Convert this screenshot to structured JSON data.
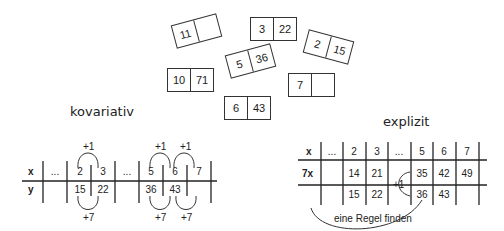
{
  "cards": [
    {
      "left": "11",
      "right": "",
      "x": 173,
      "y": 19,
      "rot": -15
    },
    {
      "left": "3",
      "right": "22",
      "x": 250,
      "y": 17,
      "rot": 0
    },
    {
      "left": "2",
      "right": "15",
      "x": 305,
      "y": 35,
      "rot": 15
    },
    {
      "left": "5",
      "right": "36",
      "x": 227,
      "y": 49,
      "rot": -15
    },
    {
      "left": "10",
      "right": "71",
      "x": 167,
      "y": 68,
      "rot": 0
    },
    {
      "left": "7",
      "right": "",
      "x": 288,
      "y": 73,
      "rot": 0
    },
    {
      "left": "6",
      "right": "43",
      "x": 224,
      "y": 96,
      "rot": 0
    }
  ],
  "kovariativ": {
    "title": "kovariativ",
    "row_labels": [
      "x",
      "y"
    ],
    "x_values": [
      "...",
      "2",
      "3",
      "...",
      "5",
      "6",
      "7"
    ],
    "y_values": [
      "",
      "15",
      "22",
      "",
      "36",
      "43",
      ""
    ],
    "top_arrows": [
      "+1",
      "+1",
      "+1"
    ],
    "bottom_arrows": [
      "+7",
      "+7",
      "+7"
    ]
  },
  "explizit": {
    "title": "explizit",
    "row_labels": [
      "x",
      "7x",
      ""
    ],
    "x_values": [
      "...",
      "2",
      "3",
      "...",
      "5",
      "6",
      "7"
    ],
    "sevenx_values": [
      "",
      "14",
      "21",
      "",
      "35",
      "42",
      "49"
    ],
    "y_values": [
      "",
      "15",
      "22",
      "",
      "36",
      "43",
      ""
    ],
    "plus_label": "+1",
    "rule_label": "eine Regel finden"
  }
}
